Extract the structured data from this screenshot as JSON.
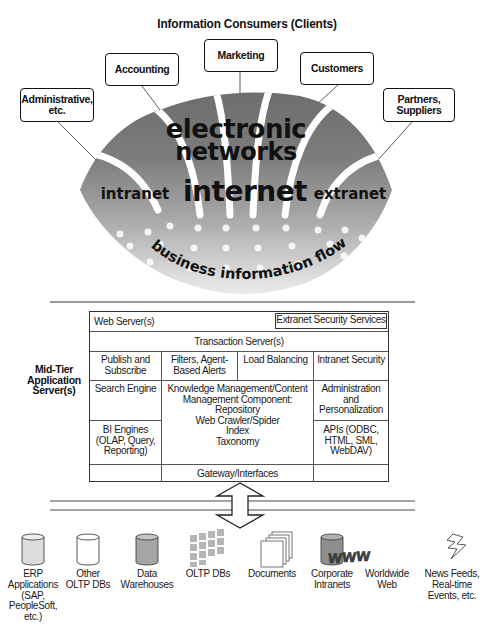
{
  "diagram": {
    "title": "Information Consumers (Clients)",
    "clients": [
      {
        "id": "administrative",
        "label": "Administrative, etc."
      },
      {
        "id": "accounting",
        "label": "Accounting"
      },
      {
        "id": "marketing",
        "label": "Marketing"
      },
      {
        "id": "customers",
        "label": "Customers"
      },
      {
        "id": "partners",
        "label": "Partners, Suppliers"
      }
    ],
    "clients_lines": {
      "administrative_1": "Administrative,",
      "administrative_2": "etc.",
      "partners_1": "Partners,",
      "partners_2": "Suppliers"
    },
    "network": {
      "line1": "electronic",
      "line2": "networks",
      "left": "intranet",
      "center": "internet",
      "right": "extranet",
      "flow": "business information flow"
    },
    "mid_tier": {
      "label_lines": [
        "Mid-Tier",
        "Application",
        "Server(s)"
      ],
      "web_server": "Web Server(s)",
      "extranet_security": "Extranet Security Services",
      "transaction_server": "Transaction Server(s)",
      "publish_subscribe": [
        "Publish and",
        "Subscribe"
      ],
      "filters_alerts": [
        "Filters, Agent-",
        "Based Alerts"
      ],
      "load_balancing": "Load Balancing",
      "intranet_security": "Intranet Security",
      "search_engine": "Search Engine",
      "km_component": [
        "Knowledge Management/Content",
        "Management Component:",
        "Repository",
        "Web Crawler/Spider",
        "Index",
        "Taxonomy"
      ],
      "administration": [
        "Administration",
        "and",
        "Personalization"
      ],
      "bi_engines": [
        "BI Engines",
        "(OLAP, Query,",
        "Reporting)"
      ],
      "apis": [
        "APIs (ODBC,",
        "HTML, SML,",
        "WebDAV)"
      ],
      "gateway": "Gateway/Interfaces"
    },
    "sources": [
      {
        "icon": "database-cylinder-icon",
        "fill": "#d9d9d9",
        "label": [
          "ERP",
          "Applications",
          "(SAP,",
          "PeopleSoft,",
          "etc.)"
        ]
      },
      {
        "icon": "database-cylinder-icon",
        "fill": "#ffffff",
        "label": [
          "Other",
          "OLTP DBs"
        ]
      },
      {
        "icon": "database-cylinder-icon",
        "fill": "#a8a8a8",
        "label": [
          "Data",
          "Warehouses"
        ]
      },
      {
        "icon": "olap-cube-icon",
        "fill": "#b8b8b8",
        "label": [
          "OLTP DBs"
        ]
      },
      {
        "icon": "documents-stack-icon",
        "fill": "#ffffff",
        "label": [
          "Documents"
        ]
      },
      {
        "icon": "database-cylinder-icon",
        "fill": "#8f8f8f",
        "label": [
          "Corporate",
          "Intranets"
        ]
      },
      {
        "icon": "www-icon",
        "fill": "#555555",
        "label": [
          "Worldwide",
          "Web"
        ],
        "glyph": "W"
      },
      {
        "icon": "lightning-bolt-icon",
        "fill": "#ffffff",
        "label": [
          "News Feeds,",
          "Real-time",
          "Events, etc."
        ]
      }
    ],
    "colors": {
      "network_dark": "#6e6e6e",
      "network_mid": "#9a9a9a",
      "network_light": "#e8e8e8",
      "border": "#333333"
    }
  }
}
